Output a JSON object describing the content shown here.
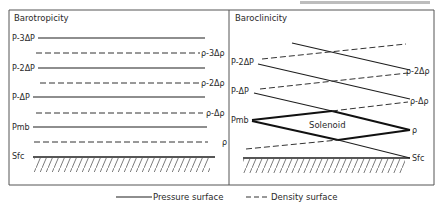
{
  "header_fragment": "",
  "panels": {
    "left": {
      "title": "Barotropicity",
      "pressure_labels": [
        "P-3ΔP",
        "P-2ΔP",
        "P-ΔP",
        "Pmb",
        "Sfc"
      ],
      "density_labels": [
        "ρ-3Δρ",
        "ρ-2Δρ",
        "ρ-Δρ",
        "ρ"
      ]
    },
    "right": {
      "title": "Baroclinicity",
      "pressure_labels": [
        "P-2ΔP",
        "P-ΔP",
        "Pmb"
      ],
      "density_labels": [
        "ρ-2Δρ",
        "ρ-Δρ",
        "ρ",
        "Sfc"
      ],
      "solenoid_label": "Solenoid"
    }
  },
  "legend": {
    "pressure": "Pressure surface",
    "density": "Density surface"
  }
}
